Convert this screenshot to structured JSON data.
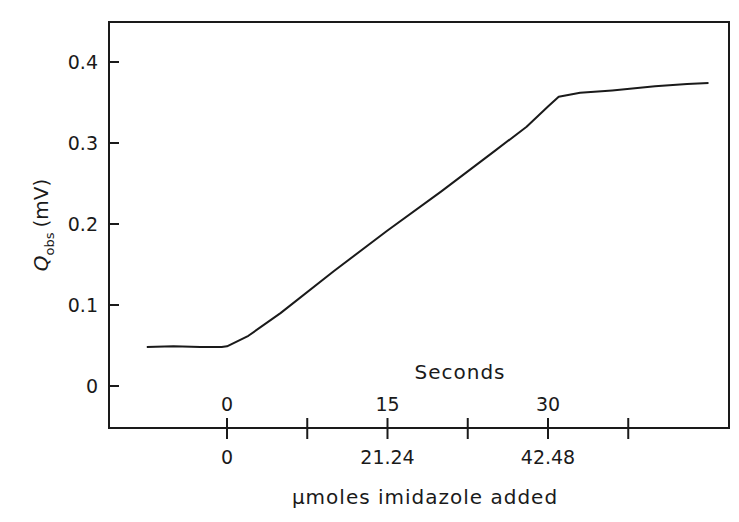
{
  "chart_data": {
    "type": "line",
    "title": "",
    "xlabel": "μmoles imidazole added",
    "xlabel_secondary": "Seconds",
    "ylabel": "Q_obs (mV)",
    "ylabel_main": "Q",
    "ylabel_sub": "obs",
    "ylabel_unit": "(mV)",
    "ylim": [
      -0.05,
      0.45
    ],
    "xlim_seconds": [
      -13,
      47
    ],
    "grid": false,
    "legend": null,
    "y_ticks": [
      {
        "value": 0,
        "label": "0"
      },
      {
        "value": 0.1,
        "label": "0.1"
      },
      {
        "value": 0.2,
        "label": "0.2"
      },
      {
        "value": 0.3,
        "label": "0.3"
      },
      {
        "value": 0.4,
        "label": "0.4"
      }
    ],
    "x_ticks_seconds": [
      {
        "value": 0,
        "label": "0"
      },
      {
        "value": 7.5,
        "label": ""
      },
      {
        "value": 15,
        "label": "15"
      },
      {
        "value": 22.5,
        "label": ""
      },
      {
        "value": 30,
        "label": "30"
      },
      {
        "value": 37.5,
        "label": ""
      }
    ],
    "x_ticks_umoles": [
      {
        "value": 0,
        "label": "0"
      },
      {
        "value": 21.24,
        "label": "21.24"
      },
      {
        "value": 42.48,
        "label": "42.48"
      }
    ],
    "series": [
      {
        "name": "Q_obs",
        "x_seconds": [
          -7.5,
          -5,
          -2.5,
          -0.5,
          0,
          2,
          5,
          10,
          15,
          20,
          25,
          28,
          30,
          31,
          33,
          36,
          40,
          43,
          45
        ],
        "values": [
          0.048,
          0.049,
          0.048,
          0.048,
          0.049,
          0.062,
          0.09,
          0.142,
          0.192,
          0.24,
          0.29,
          0.32,
          0.345,
          0.357,
          0.362,
          0.365,
          0.37,
          0.373,
          0.374
        ]
      }
    ]
  }
}
